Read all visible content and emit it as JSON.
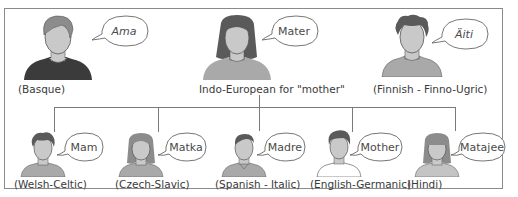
{
  "diagram": {
    "colors": {
      "border": "#8a8a8a",
      "connector": "#7a7a7a",
      "skin": "#c9c9c9",
      "hair_dark": "#5a5a5a",
      "hair_light": "#8c8c8c",
      "shirt_dark": "#3b3b3b",
      "shirt_light": "#a9a9a9",
      "text": "#3a3a3a"
    },
    "top_row": [
      {
        "word": "Ama",
        "word_style": "italic",
        "caption": "(Basque)"
      },
      {
        "word": "Mater",
        "word_style": "normal",
        "caption": "Indo-European for \"mother\""
      },
      {
        "word": "Äiti",
        "word_style": "italic",
        "caption": "(Finnish - Finno-Ugric)"
      }
    ],
    "bottom_row": [
      {
        "word": "Mam",
        "caption": "(Welsh-Celtic)"
      },
      {
        "word": "Matka",
        "caption": "(Czech-Slavic)"
      },
      {
        "word": "Madre",
        "caption": "(Spanish - Italic)"
      },
      {
        "word": "Mother",
        "caption": "(English-Germanic)"
      },
      {
        "word": "Matajee",
        "caption": "(Hindi)"
      }
    ]
  }
}
